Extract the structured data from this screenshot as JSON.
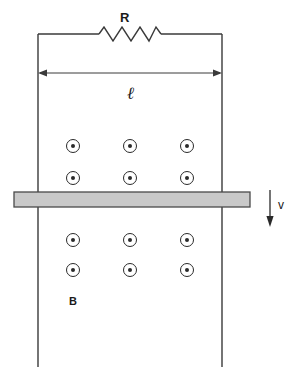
{
  "figure": {
    "labels": {
      "resistor": "R",
      "length": "ℓ",
      "field": "B",
      "velocity": "v"
    },
    "colors": {
      "line": "#3a3a3a",
      "bar_fill": "#c9c9c9",
      "bar_stroke": "#4a4a4a",
      "text": "#1a1a1a",
      "background": "#ffffff"
    },
    "icons": {
      "resistor": "resistor-zigzag-icon",
      "field_dot": "field-out-of-page-dot-icon",
      "velocity": "down-arrow-icon",
      "length": "double-headed-arrow-icon"
    },
    "circuit": {
      "left_rail_x": 38,
      "right_rail_x": 222,
      "top_wire_y": 34,
      "rail_bottom_y": 367,
      "resistor_zigzag_peaks": 6,
      "resistor_span_x": [
        99,
        161
      ]
    },
    "length_arrow": {
      "y": 73,
      "x_start": 38,
      "x_end": 222
    },
    "bar": {
      "x": 14,
      "y": 192,
      "width": 236,
      "height": 15
    },
    "velocity_arrow": {
      "x": 270,
      "y_start": 190,
      "y_end": 226
    },
    "field_dots": {
      "symbol": "⊙",
      "columns_x": [
        73,
        130,
        187
      ],
      "rows_y": [
        146,
        178,
        240,
        270
      ],
      "radius": 6.5,
      "dot_radius": 2,
      "count": 12
    }
  }
}
